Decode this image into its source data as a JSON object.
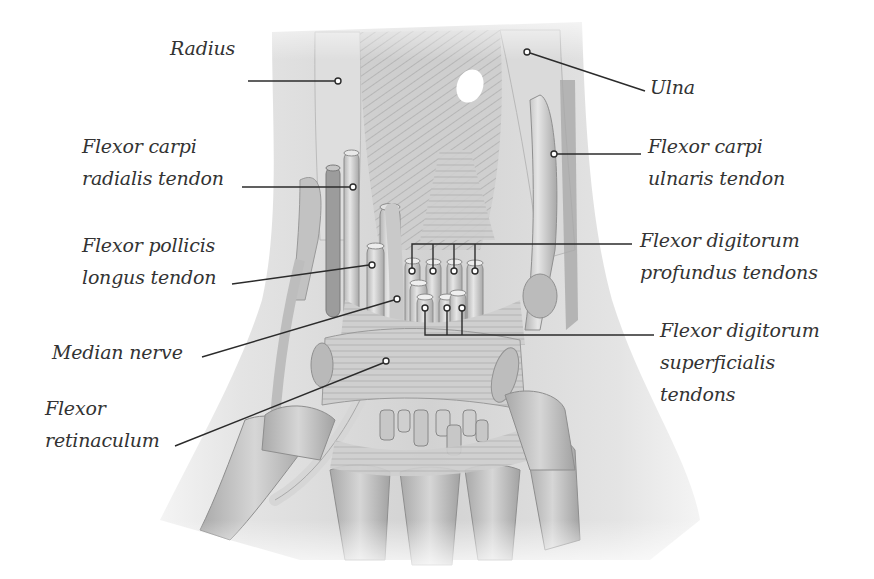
{
  "figure": {
    "colors": {
      "background": "#ffffff",
      "skin": "#e9e9e9",
      "tissue": "#c9c9c9",
      "tissue_dark": "#9a9a9a",
      "bone": "#bdbdbd",
      "leader_line": "#2b2b2b",
      "label_text": "#333333"
    }
  },
  "labels": {
    "radius": {
      "lines": [
        "Radius"
      ]
    },
    "ulna": {
      "lines": [
        "Ulna"
      ]
    },
    "flexor_carpi_radialis": {
      "lines": [
        "Flexor carpi",
        "radialis tendon"
      ]
    },
    "flexor_carpi_ulnaris": {
      "lines": [
        "Flexor carpi",
        "ulnaris tendon"
      ]
    },
    "flexor_pollicis_longus": {
      "lines": [
        "Flexor pollicis",
        "longus tendon"
      ]
    },
    "flexor_digitorum_profundus": {
      "lines": [
        "Flexor digitorum",
        "profundus tendons"
      ]
    },
    "median_nerve": {
      "lines": [
        "Median nerve"
      ]
    },
    "flexor_digitorum_superficialis": {
      "lines": [
        "Flexor digitorum",
        "superficialis",
        "tendons"
      ]
    },
    "flexor_retinaculum": {
      "lines": [
        "Flexor",
        "retinaculum"
      ]
    }
  }
}
